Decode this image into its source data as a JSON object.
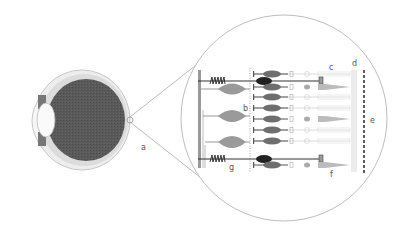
{
  "diagram": {
    "type": "anatomical-illustration",
    "labels": {
      "a": "a",
      "b": "b",
      "c": "c",
      "d": "d",
      "e": "e",
      "f": "f",
      "g": "g"
    },
    "colors": {
      "vitreous": "#5a5a5a",
      "sclera": "#d8d8d8",
      "lens": "#f4f4f4",
      "ganglion_cell": "#9a9a9a",
      "bipolar_cell": "#6e6e6e",
      "dark_cell": "#222222",
      "outline": "#b0b0b0",
      "dashed_line": "#333333"
    },
    "rows": [
      {
        "y": 73,
        "type": "cone"
      },
      {
        "y": 80,
        "type": "dark"
      },
      {
        "y": 86,
        "type": "rod"
      },
      {
        "y": 97,
        "type": "cone"
      },
      {
        "y": 108,
        "type": "cone"
      },
      {
        "y": 119,
        "type": "rod"
      },
      {
        "y": 130,
        "type": "cone"
      },
      {
        "y": 141,
        "type": "cone"
      },
      {
        "y": 152,
        "type": "dark"
      },
      {
        "y": 159,
        "type": "rod"
      }
    ]
  }
}
